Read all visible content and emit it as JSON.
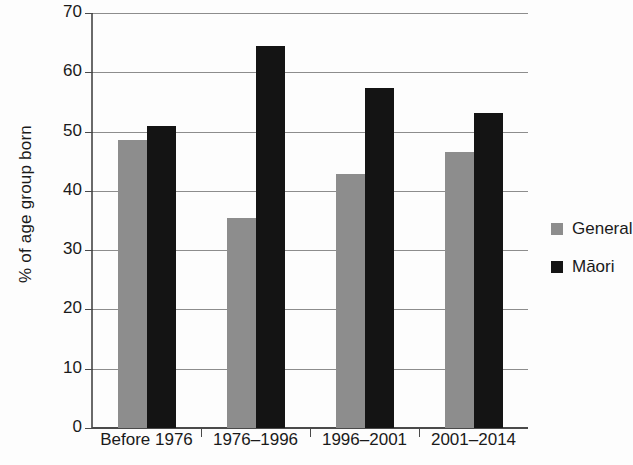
{
  "chart_data": {
    "type": "bar",
    "title": "",
    "subtitle": "",
    "xlabel": "",
    "ylabel": "% of age group born",
    "categories": [
      "Before 1976",
      "1976–1996",
      "1996–2001",
      "2001–2014"
    ],
    "series": [
      {
        "name": "General",
        "color": "#8d8d8d",
        "values": [
          48.5,
          35.4,
          42.9,
          46.6
        ]
      },
      {
        "name": "Māori",
        "color": "#141414",
        "values": [
          51.0,
          64.5,
          57.3,
          53.2
        ]
      }
    ],
    "ylim": [
      0,
      70
    ],
    "ytick_labels": [
      "0",
      "10",
      "20",
      "30",
      "40",
      "50",
      "60",
      "70"
    ],
    "ytick_values": [
      0,
      10,
      20,
      30,
      40,
      50,
      60,
      70
    ],
    "grid": "horizontal",
    "legend_position": "right",
    "legend_entries": [
      "General",
      "Māori"
    ]
  }
}
